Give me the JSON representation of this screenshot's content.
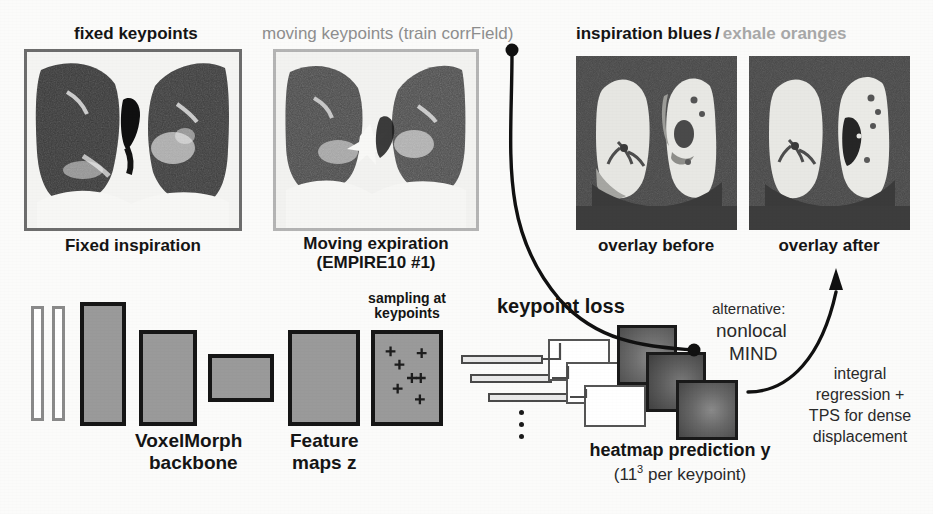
{
  "figure": {
    "background_color": "#fbfbfa"
  },
  "headers": {
    "fixed_keypoints": "fixed keypoints",
    "moving_keypoints": "moving keypoints (train corrField)",
    "overlay_header_dark": "inspiration blues",
    "overlay_header_slash": "/",
    "overlay_header_light": "exhale oranges"
  },
  "panels": [
    {
      "name": "fixed-inspiration",
      "caption_line1": "Fixed inspiration",
      "caption_line2": "",
      "frame_color": "#6d6d6d"
    },
    {
      "name": "moving-expiration",
      "caption_line1": "Moving expiration",
      "caption_line2": "(EMPIRE10 #1)",
      "frame_color": "#b4b4b4"
    },
    {
      "name": "overlay-before",
      "caption_line1": "overlay before",
      "caption_line2": "",
      "frame_color": "#4b4b4b"
    },
    {
      "name": "overlay-after",
      "caption_line1": "overlay after",
      "caption_line2": "",
      "frame_color": "#4b4b4b"
    }
  ],
  "network": {
    "backbone_label_line1": "VoxelMorph",
    "backbone_label_line2": "backbone",
    "feature_label_line1": "Feature",
    "feature_label_line2": "maps z",
    "sampling_label_line1": "sampling at",
    "sampling_label_line2": "keypoints",
    "keypoint_loss_label": "keypoint loss",
    "heatmap_label": "heatmap prediction y",
    "heatmap_sub_pre": "(11",
    "heatmap_sub_exp": "3",
    "heatmap_sub_post": " per keypoint)",
    "vertical_dots": 3,
    "keypoint_marks": 7
  },
  "annotations": {
    "alternative_line1": "alternative:",
    "alternative_line2": "nonlocal",
    "alternative_line3": "MIND",
    "integral_line1": "integral",
    "integral_line2": "regression +",
    "integral_line3": "TPS for dense",
    "integral_line4": "displacement"
  },
  "colors": {
    "ink": "#151515",
    "gray_text": "#8e8e8e",
    "light_gray_text": "#a8a8a8",
    "block_fill": "#9a9a9a",
    "block_border": "#161616",
    "overlay_bg": "#4b4b4b"
  }
}
